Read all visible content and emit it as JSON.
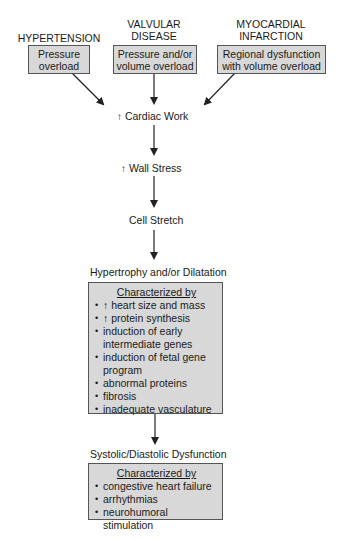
{
  "sources": [
    {
      "title": "HYPERTENSION",
      "box": "Pressure overload",
      "box_lines": [
        "Pressure",
        "overload"
      ]
    },
    {
      "title": "VALVULAR DISEASE",
      "title_lines": [
        "VALVULAR",
        "DISEASE"
      ],
      "box": "Pressure and/or volume overload",
      "box_lines": [
        "Pressure and/or",
        "volume overload"
      ]
    },
    {
      "title": "MYOCARDIAL INFARCTION",
      "title_lines": [
        "MYOCARDIAL",
        "INFARCTION"
      ],
      "box": "Regional dysfunction with volume overload",
      "box_lines": [
        "Regional dysfunction",
        "with volume overload"
      ]
    }
  ],
  "flow": {
    "cardiac_work": {
      "prefix": "↑",
      "label": "Cardiac Work"
    },
    "wall_stress": {
      "prefix": "↑",
      "label": "Wall Stress"
    },
    "cell_stretch": "Cell Stretch",
    "hypertrophy": "Hypertrophy and/or Dilatation",
    "dysfunction": "Systolic/Diastolic Dysfunction"
  },
  "hypertrophy_box": {
    "heading": "Characterized by",
    "items": [
      "↑ heart size and mass",
      "↑ protein synthesis",
      "induction of early intermediate genes",
      "induction of fetal gene program",
      "abnormal proteins",
      "fibrosis",
      "inadequate vasculature"
    ]
  },
  "dysfunction_box": {
    "heading": "Characterized by",
    "items": [
      "congestive heart failure",
      "arrhythmias",
      "neurohumoral stimulation"
    ]
  },
  "colors": {
    "box_fill": "#d8d8d8",
    "border": "#555555",
    "arrow": "#222222"
  }
}
